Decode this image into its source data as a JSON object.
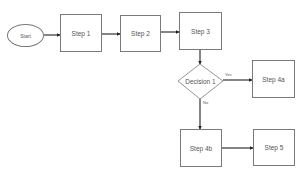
{
  "diagram": {
    "type": "flowchart",
    "nodes": {
      "start": {
        "label": "Start",
        "shape": "ellipse"
      },
      "step1": {
        "label": "Step 1",
        "shape": "rectangle"
      },
      "step2": {
        "label": "Step 2",
        "shape": "rectangle"
      },
      "step3": {
        "label": "Step 3",
        "shape": "rectangle"
      },
      "decision1": {
        "label": "Decision 1",
        "shape": "diamond"
      },
      "step4a": {
        "label": "Step 4a",
        "shape": "rectangle"
      },
      "step4b": {
        "label": "Step 4b",
        "shape": "rectangle"
      },
      "step5": {
        "label": "Step 5",
        "shape": "rectangle"
      }
    },
    "edges": [
      {
        "from": "Start",
        "to": "Step 1",
        "label": ""
      },
      {
        "from": "Step 1",
        "to": "Step 2",
        "label": ""
      },
      {
        "from": "Step 2",
        "to": "Step 3",
        "label": ""
      },
      {
        "from": "Step 3",
        "to": "Decision 1",
        "label": ""
      },
      {
        "from": "Decision 1",
        "to": "Step 4a",
        "label": "Yes"
      },
      {
        "from": "Decision 1",
        "to": "Step 4b",
        "label": "No"
      },
      {
        "from": "Step 4b",
        "to": "Step 5",
        "label": ""
      }
    ],
    "edge_labels": {
      "yes": "Yes",
      "no": "No"
    },
    "colors": {
      "stroke": "#7a7a7a",
      "arrow": "#222222",
      "text": "#555555",
      "background": "#ffffff"
    }
  }
}
